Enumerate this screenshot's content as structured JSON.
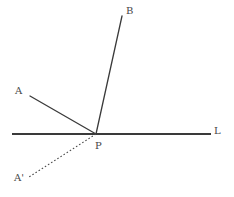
{
  "diagram": {
    "type": "geometry-reflection-diagram",
    "background_color": "#ffffff",
    "stroke_color": "#3a3a3a",
    "label_color": "#474747",
    "labels": {
      "A": "A",
      "A_prime": "A'",
      "B": "B",
      "L": "L",
      "P": "P"
    },
    "points": {
      "A": {
        "x": 30,
        "y": 96
      },
      "A_prime": {
        "x": 29,
        "y": 177
      },
      "B": {
        "x": 122,
        "y": 16
      },
      "P": {
        "x": 96,
        "y": 134
      },
      "L_start": {
        "x": 12,
        "y": 134
      },
      "L_end": {
        "x": 211,
        "y": 134
      }
    },
    "segments": [
      {
        "name": "line-L",
        "from": "L_start",
        "to": "L_end",
        "style": "solid",
        "width": 2.0
      },
      {
        "name": "ray-PA",
        "from": "P",
        "to": "A",
        "style": "solid",
        "width": 1.3
      },
      {
        "name": "ray-PB",
        "from": "P",
        "to": "B",
        "style": "solid",
        "width": 1.3
      },
      {
        "name": "ray-PAprime",
        "from": "P",
        "to": "A_prime",
        "style": "dotted",
        "width": 1.1,
        "dash_pattern": "1.6 2.1"
      }
    ]
  }
}
